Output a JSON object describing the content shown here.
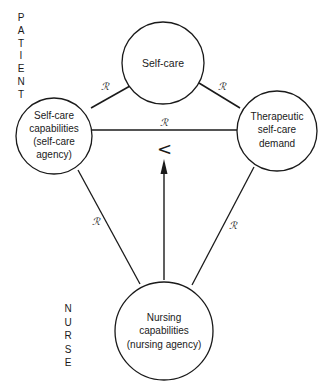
{
  "diagram": {
    "side_labels": {
      "patient": [
        "P",
        "A",
        "T",
        "I",
        "E",
        "N",
        "T"
      ],
      "nurse": [
        "N",
        "U",
        "R",
        "S",
        "E"
      ]
    },
    "nodes": {
      "self_care": {
        "lines": [
          "Self-care"
        ]
      },
      "self_care_capabilities": {
        "lines": [
          "Self-care",
          "capabilities",
          "(self-care",
          "agency)"
        ]
      },
      "therapeutic_demand": {
        "lines": [
          "Therapeutic",
          "self-care",
          "demand"
        ]
      },
      "nursing_capabilities": {
        "lines": [
          "Nursing",
          "capabilities",
          "(nursing agency)"
        ]
      }
    },
    "relations": {
      "symbol": "ℛ",
      "capabilities_to_self_care": "ℛ",
      "self_care_to_demand": "ℛ",
      "capabilities_to_demand": "ℛ",
      "capabilities_to_nursing": "ℛ",
      "demand_to_nursing": "ℛ"
    },
    "deficit_symbol": "<",
    "colors": {
      "line": "#1a1a1a",
      "background": "#ffffff"
    }
  }
}
